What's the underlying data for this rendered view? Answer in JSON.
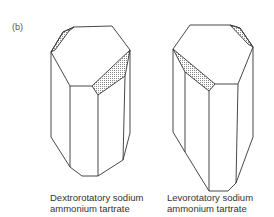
{
  "figure": {
    "panel_label": "(b)",
    "crystals": [
      {
        "name": "dextrorotatory",
        "caption_line1": "Dextrorotatory sodium",
        "caption_line2": "ammonium tartrate"
      },
      {
        "name": "levorotatory",
        "caption_line1": "Levorotatory sodium",
        "caption_line2": "ammonium tartrate"
      }
    ],
    "colors": {
      "stroke": "#333333",
      "shade": "#cfcfcf",
      "background": "#ffffff"
    }
  }
}
